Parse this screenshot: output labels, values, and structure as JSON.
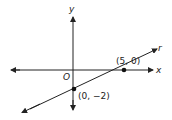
{
  "diagram": {
    "type": "coordinate-plane-line",
    "axes": {
      "x_label": "x",
      "y_label": "y",
      "origin_label": "O"
    },
    "line": {
      "name": "r",
      "points": [
        {
          "label": "(5, 0)",
          "x": 5,
          "y": 0
        },
        {
          "label": "(0, −2)",
          "x": 0,
          "y": -2
        }
      ]
    },
    "colors": {
      "stroke": "#222222",
      "background": "#ffffff"
    }
  }
}
